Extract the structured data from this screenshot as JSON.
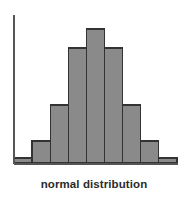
{
  "figure": {
    "caption": "normal distribution",
    "background_color": "#ffffff"
  },
  "style": {
    "bar_fill": "#8a8a8a",
    "bar_stroke": "#333333",
    "axis_color": "#555555",
    "caption_color": "#2b2b2b",
    "bar_stroke_width": 1.2,
    "axis_stroke_width": 1.6
  },
  "geometry": {
    "baseline_y": 163,
    "axis_x": 14,
    "axis_top_y": 15,
    "baseline_x_start": 14,
    "baseline_x_end": 178,
    "bar_left_x": 14,
    "bar_width": 18.1,
    "bar_tops_y": [
      158,
      141,
      105,
      48,
      29,
      48,
      105,
      141,
      158
    ]
  },
  "chart_data": {
    "type": "bar",
    "title": "normal distribution",
    "subtitle": "",
    "xlabel": "normal distribution",
    "ylabel": "",
    "grid": false,
    "legend": false,
    "legend_position": "none",
    "categories": [
      "1",
      "2",
      "3",
      "4",
      "5",
      "6",
      "7",
      "8",
      "9"
    ],
    "tick_labels": [],
    "values": [
      5,
      22,
      58,
      115,
      134,
      115,
      58,
      22,
      5
    ],
    "ylim": [
      0,
      148
    ],
    "xlim": [
      0,
      9
    ],
    "annotations": []
  }
}
